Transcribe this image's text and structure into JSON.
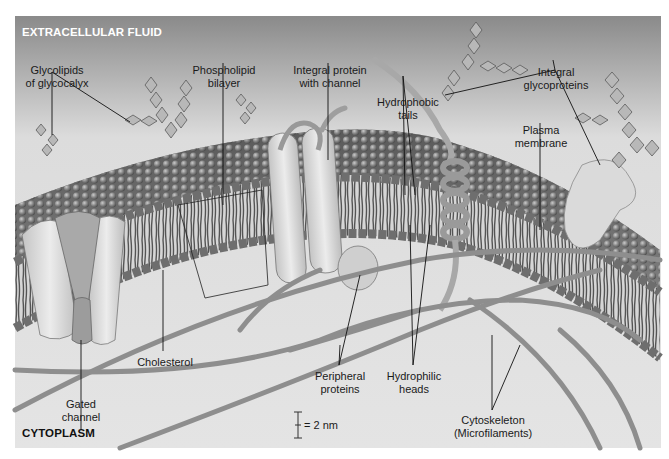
{
  "figure": {
    "colors": {
      "top_background": "#8c8c8c",
      "bottom_background": "#d9d9d9",
      "membrane_heads": "#8a8a8a",
      "protein": "#d8d8d8",
      "filament": "#9a9a9a",
      "line": "#111111"
    },
    "regions": {
      "top": "EXTRACELLULAR FLUID",
      "bottom": "CYTOPLASM"
    },
    "labels": {
      "glycolipids_1": "Glycolipids",
      "glycolipids_2": "of glycocalyx",
      "phospholipid_1": "Phospholipid",
      "phospholipid_2": "bilayer",
      "integral_channel_1": "Integral protein",
      "integral_channel_2": "with channel",
      "hydrophobic_1": "Hydrophobic",
      "hydrophobic_2": "tails",
      "glycoproteins_1": "Integral",
      "glycoproteins_2": "glycoproteins",
      "plasma_1": "Plasma",
      "plasma_2": "membrane",
      "gated_1": "Gated",
      "gated_2": "channel",
      "cholesterol": "Cholesterol",
      "peripheral_1": "Peripheral",
      "peripheral_2": "proteins",
      "hydrophilic_1": "Hydrophilic",
      "hydrophilic_2": "heads",
      "cytoskeleton_1": "Cytoskeleton",
      "cytoskeleton_2": "(Microfilaments)"
    },
    "scale_bar": {
      "text": "= 2 nm"
    }
  }
}
